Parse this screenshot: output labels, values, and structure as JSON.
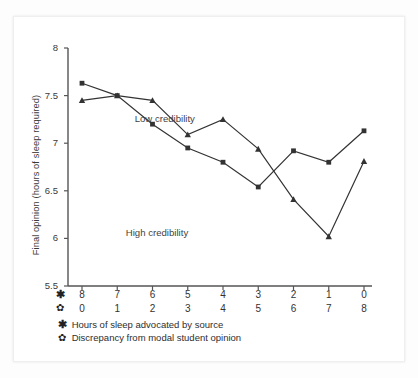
{
  "chart_data": {
    "type": "line",
    "title": "",
    "xlabel": "",
    "ylabel": "Final opinion (hours of sleep required)",
    "ylim": [
      5.5,
      8
    ],
    "yticks": [
      "8",
      "7.5",
      "7",
      "6.5",
      "6",
      "5.5"
    ],
    "ytick_values": [
      8,
      7.5,
      7,
      6.5,
      6,
      5.5
    ],
    "grid": false,
    "legend_position": "inline-annotations",
    "categories": [
      "8",
      "7",
      "6",
      "5",
      "4",
      "3",
      "2",
      "1",
      "0"
    ],
    "x_axis_rows": [
      {
        "symbol": "✱",
        "symbol_name": "bold-asterisk",
        "description": "Hours of sleep advocated by source",
        "ticks": [
          "8",
          "7",
          "6",
          "5",
          "4",
          "3",
          "2",
          "1",
          "0"
        ]
      },
      {
        "symbol": "✿",
        "symbol_name": "open-asterisk-flower",
        "description": "Discrepancy from modal student opinion",
        "ticks": [
          "0",
          "1",
          "2",
          "3",
          "4",
          "5",
          "6",
          "7",
          "8"
        ]
      }
    ],
    "series": [
      {
        "name": "Low credibility",
        "marker": "square",
        "color": "#333333",
        "values": [
          7.63,
          7.5,
          7.2,
          6.95,
          6.8,
          6.54,
          6.92,
          6.8,
          7.13
        ]
      },
      {
        "name": "High credibility",
        "marker": "triangle",
        "color": "#333333",
        "values": [
          7.45,
          7.5,
          7.45,
          7.09,
          7.25,
          6.94,
          6.41,
          6.02,
          6.81
        ]
      }
    ],
    "annotations": [
      {
        "text": "Low credibility",
        "x": 1.55,
        "y": 7.24
      },
      {
        "text": "High credibility",
        "x": 1.3,
        "y": 6.05
      }
    ]
  },
  "colors": {
    "line": "#333333",
    "axis": "#555555",
    "text": "#333333",
    "card_bg": "#ffffff",
    "page_bg": "#fdfdfd"
  }
}
